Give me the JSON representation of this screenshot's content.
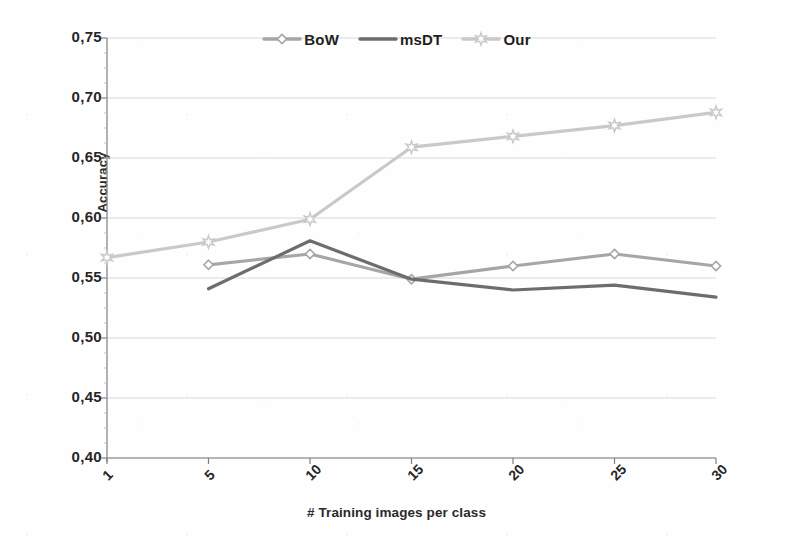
{
  "chart_data": {
    "type": "line",
    "title": "",
    "xlabel": "# Training images per class",
    "ylabel": "Accuracy",
    "categories": [
      "1",
      "5",
      "10",
      "15",
      "20",
      "25",
      "30"
    ],
    "x": [
      1,
      5,
      10,
      15,
      20,
      25,
      30
    ],
    "ylim": [
      0.4,
      0.75
    ],
    "ytick_labels": [
      "0,75",
      "0,70",
      "0,65",
      "0,60",
      "0,55",
      "0,50",
      "0,45",
      "0,40"
    ],
    "ytick_values": [
      0.75,
      0.7,
      0.65,
      0.6,
      0.55,
      0.5,
      0.45,
      0.4
    ],
    "grid": true,
    "legend_position": "top-center",
    "decimal_separator": ",",
    "series": [
      {
        "name": "BoW",
        "color": "#a6a6a6",
        "marker": "diamond",
        "values": [
          null,
          0.561,
          0.57,
          0.549,
          0.56,
          0.57,
          0.56
        ]
      },
      {
        "name": "msDT",
        "color": "#6d6d6d",
        "marker": "none",
        "values": [
          null,
          0.541,
          0.581,
          0.549,
          0.54,
          0.544,
          0.534
        ]
      },
      {
        "name": "Our",
        "color": "#c9c9c9",
        "marker": "star",
        "values": [
          0.567,
          0.58,
          0.599,
          0.659,
          0.668,
          0.677,
          0.688
        ]
      }
    ]
  },
  "legend": {
    "items": [
      {
        "label": "BoW",
        "icon": "diamond-marker-icon"
      },
      {
        "label": "msDT",
        "icon": "line-swatch-icon"
      },
      {
        "label": "Our",
        "icon": "star-marker-icon"
      }
    ]
  },
  "axes": {
    "y_title": "Accuracy",
    "x_title": "# Training images per class"
  },
  "colors": {
    "background": "#fefefe",
    "axis": "#7f7f7f",
    "grid": "#d9d9d9",
    "text": "#262626",
    "series_bow": "#a6a6a6",
    "series_msdt": "#6d6d6d",
    "series_our": "#c9c9c9"
  }
}
